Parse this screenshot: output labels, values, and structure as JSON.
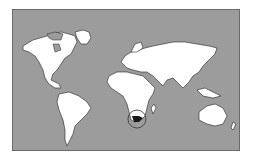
{
  "map": {
    "type": "world-locator",
    "highlighted_region": "South Africa",
    "colors": {
      "ocean": "#9c9c9c",
      "land": "#ffffff",
      "highlight": "#1a1a1a",
      "border": "#222222"
    }
  }
}
